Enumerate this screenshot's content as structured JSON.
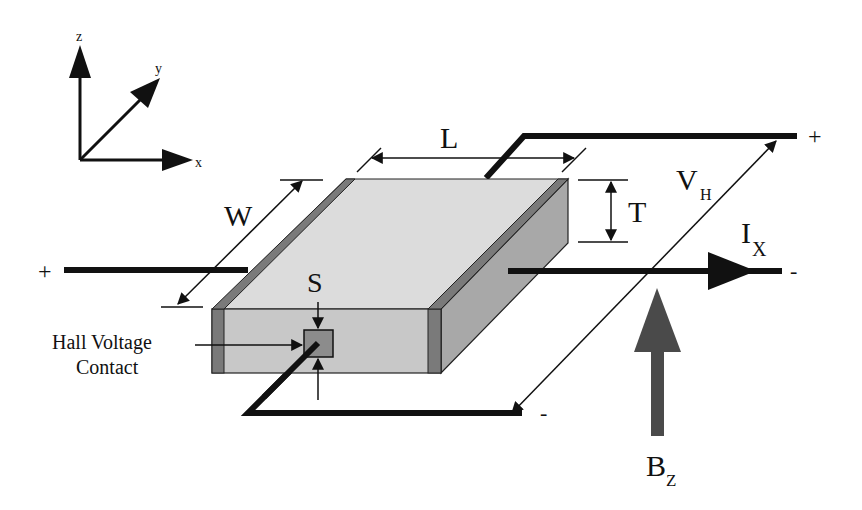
{
  "figure": {
    "axes": {
      "x_label": "x",
      "y_label": "y",
      "z_label": "z"
    },
    "dimensions": {
      "length": "L",
      "width": "W",
      "thickness": "T",
      "contact_size": "S"
    },
    "callout": {
      "line1": "Hall Voltage",
      "line2": "Contact"
    },
    "current": {
      "symbol": "I",
      "subscript": "X",
      "plus": "+",
      "minus": "-"
    },
    "hall_voltage": {
      "symbol": "V",
      "subscript": "H",
      "plus": "+",
      "minus": "-"
    },
    "magnetic_field": {
      "symbol": "B",
      "subscript": "Z"
    },
    "colors": {
      "top_face": "#dcdcdc",
      "front_face": "#c8c8c8",
      "side_face": "#a8a8a8",
      "electrode": "#7a7a7a",
      "contact": "#8c8c8c",
      "field_arrow": "#4a4a4a",
      "ink": "#111111"
    }
  }
}
